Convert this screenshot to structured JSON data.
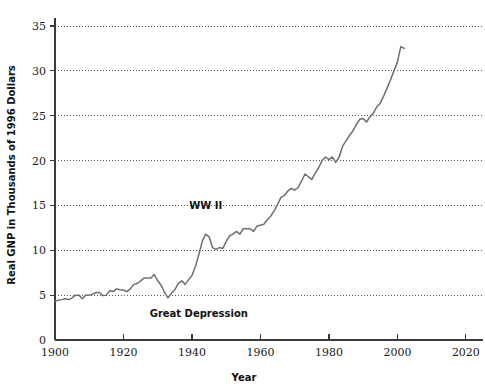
{
  "chart_data": {
    "type": "line",
    "title": "",
    "xlabel": "Year",
    "ylabel": "Real GNP in Thousands of 1996 Dollars",
    "xlim": [
      1900,
      2025
    ],
    "ylim": [
      0,
      36
    ],
    "xticks": [
      1900,
      1920,
      1940,
      1960,
      1980,
      2000,
      2020
    ],
    "xtick_labels": [
      "1900",
      "1920",
      "1940",
      "1960",
      "1980",
      "2000",
      "2020"
    ],
    "yticks": [
      0,
      5,
      10,
      15,
      20,
      25,
      30,
      35
    ],
    "ytick_labels": [
      "0",
      "5",
      "10",
      "15",
      "20",
      "25",
      "30",
      "35"
    ],
    "grid": "horizontal-dotted",
    "legend": "none",
    "line_color": "#6e6e6e",
    "axis_color": "#3a3a3a",
    "grid_color": "#555555",
    "series": [
      {
        "name": "Real GNP per capita",
        "x": [
          1900,
          1901,
          1902,
          1903,
          1904,
          1905,
          1906,
          1907,
          1908,
          1909,
          1910,
          1911,
          1912,
          1913,
          1914,
          1915,
          1916,
          1917,
          1918,
          1919,
          1920,
          1921,
          1922,
          1923,
          1924,
          1925,
          1926,
          1927,
          1928,
          1929,
          1930,
          1931,
          1932,
          1933,
          1934,
          1935,
          1936,
          1937,
          1938,
          1939,
          1940,
          1941,
          1942,
          1943,
          1944,
          1945,
          1946,
          1947,
          1948,
          1949,
          1950,
          1951,
          1952,
          1953,
          1954,
          1955,
          1956,
          1957,
          1958,
          1959,
          1960,
          1961,
          1962,
          1963,
          1964,
          1965,
          1966,
          1967,
          1968,
          1969,
          1970,
          1971,
          1972,
          1973,
          1974,
          1975,
          1976,
          1977,
          1978,
          1979,
          1980,
          1981,
          1982,
          1983,
          1984,
          1985,
          1986,
          1987,
          1988,
          1989,
          1990,
          1991,
          1992,
          1993,
          1994,
          1995,
          1996,
          1997,
          1998,
          1999,
          2000,
          2001,
          2002
        ],
        "values": [
          4.3,
          4.45,
          4.5,
          4.6,
          4.5,
          4.7,
          5.0,
          5.0,
          4.6,
          5.0,
          5.0,
          5.1,
          5.3,
          5.3,
          4.95,
          5.0,
          5.5,
          5.4,
          5.7,
          5.6,
          5.55,
          5.4,
          5.7,
          6.2,
          6.3,
          6.6,
          6.9,
          6.9,
          6.9,
          7.3,
          6.6,
          6.1,
          5.3,
          4.7,
          5.2,
          5.6,
          6.3,
          6.6,
          6.2,
          6.7,
          7.2,
          8.2,
          9.5,
          11.0,
          11.8,
          11.5,
          10.3,
          10.1,
          10.3,
          10.2,
          11.0,
          11.6,
          11.8,
          12.1,
          11.8,
          12.4,
          12.4,
          12.4,
          12.1,
          12.7,
          12.8,
          12.9,
          13.4,
          13.8,
          14.4,
          15.1,
          15.9,
          16.1,
          16.6,
          16.9,
          16.7,
          17.0,
          17.7,
          18.5,
          18.2,
          17.9,
          18.6,
          19.2,
          20.0,
          20.4,
          20.1,
          20.4,
          19.8,
          20.4,
          21.6,
          22.2,
          22.8,
          23.3,
          24.0,
          24.6,
          24.7,
          24.3,
          24.9,
          25.3,
          26.0,
          26.4,
          27.2,
          28.1,
          29.0,
          30.0,
          31.0,
          32.7,
          32.5
        ]
      }
    ],
    "annotations": [
      {
        "text": "WW II",
        "x": 1944,
        "y": 14.6,
        "anchor": "middle"
      },
      {
        "text": "Great Depression",
        "x": 1942,
        "y": 2.6,
        "anchor": "middle"
      }
    ]
  }
}
